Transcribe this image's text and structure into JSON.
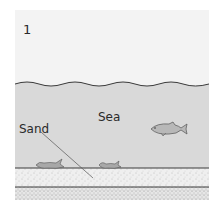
{
  "figure": {
    "panel_number": "1",
    "labels": {
      "sea": "Sea",
      "sand": "Sand"
    },
    "elements": [
      {
        "name": "water-surface",
        "type": "wavy-line"
      },
      {
        "name": "sea-water",
        "color": "#d9d9d9"
      },
      {
        "name": "swimming-fish",
        "count": 1
      },
      {
        "name": "dead-fish-on-seabed",
        "count": 2
      },
      {
        "name": "sand-layer-upper",
        "texture": "stippled"
      },
      {
        "name": "sand-layer-lower",
        "texture": "stippled-dense"
      }
    ],
    "colors": {
      "sky": "#f3f3f3",
      "sea": "#d9d9d9",
      "sand": "#ececec",
      "line": "#3a3a3a"
    }
  }
}
